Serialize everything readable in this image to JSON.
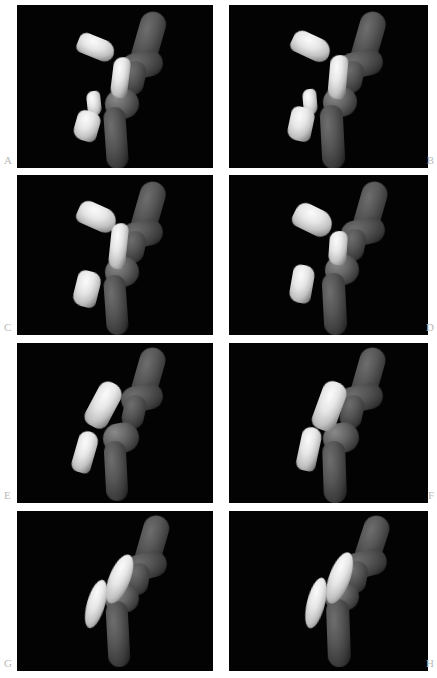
{
  "figure": {
    "type": "multi-panel-3d-render-grid",
    "background_color": "#ffffff",
    "panel_background_color": "#000000",
    "label_color": "#b9b9b9",
    "rows": 4,
    "columns": 2,
    "panel_count": 8,
    "caption": ""
  },
  "panels": [
    {
      "label": "A",
      "label_position": "bottom-left",
      "column": "left",
      "row": 1,
      "description": "3D volume rendering of a joint: dark grey curved bone shaft on the right with four bright separated bone fragments on the left"
    },
    {
      "label": "B",
      "label_position": "bottom-right",
      "column": "right",
      "row": 1,
      "description": "3D volume rendering of a joint: dark grey curved bone shaft with four bright bone fragments, slightly rotated view"
    },
    {
      "label": "C",
      "label_position": "bottom-left",
      "column": "left",
      "row": 2,
      "description": "3D volume rendering of a joint with three bright bone fragments beside the dark shaft"
    },
    {
      "label": "D",
      "label_position": "bottom-right",
      "column": "right",
      "row": 2,
      "description": "3D volume rendering of a joint with three bright bone fragments, rotated view"
    },
    {
      "label": "E",
      "label_position": "bottom-left",
      "column": "left",
      "row": 3,
      "description": "3D volume rendering of a joint with two elongated bright bone fragments beside the dark shaft"
    },
    {
      "label": "F",
      "label_position": "bottom-right",
      "column": "right",
      "row": 3,
      "description": "3D volume rendering of a joint with two elongated bright bone fragments, rotated view"
    },
    {
      "label": "G",
      "label_position": "bottom-left",
      "column": "left",
      "row": 4,
      "description": "3D volume rendering of a joint with two slender spindle-shaped bright bone fragments"
    },
    {
      "label": "H",
      "label_position": "bottom-right",
      "column": "right",
      "row": 4,
      "description": "3D volume rendering of a joint with two slender spindle-shaped bright bone fragments, rotated view"
    }
  ]
}
